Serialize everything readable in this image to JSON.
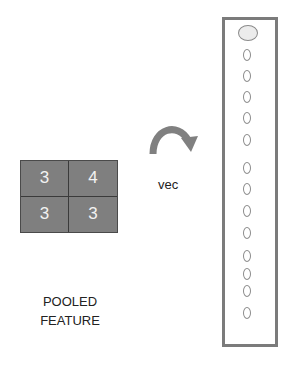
{
  "pooled_feature": {
    "values": [
      [
        3,
        4
      ],
      [
        3,
        3
      ]
    ],
    "label_line1": "POOLED",
    "label_line2": "FEATURE"
  },
  "operation": {
    "label": "vec",
    "icon": "curved-arrow-right-icon"
  },
  "vector": {
    "node_count": 13,
    "has_bias_node": true
  },
  "colors": {
    "cell_fill": "#7f7f7f",
    "cell_text": "#f2f2f2",
    "frame": "#7b7b7b",
    "node_outline": "#8c8c8c",
    "bias_fill": "#ececec"
  }
}
